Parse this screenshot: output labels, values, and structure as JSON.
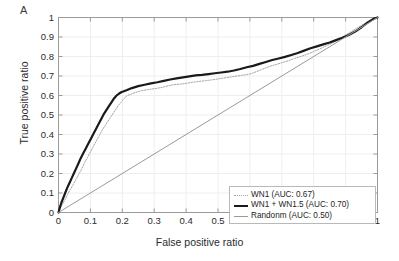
{
  "panel": {
    "label": "A"
  },
  "axes": {
    "xlabel": "False positive ratio",
    "ylabel": "True positive ratio",
    "xticks": [
      "0",
      "0.1",
      "0.2",
      "0.3",
      "0.4",
      "0.5",
      "0.6",
      "0.7",
      "0.8",
      "0.9",
      "1"
    ],
    "yticks": [
      "1",
      "0.9",
      "0.8",
      "0.7",
      "0.6",
      "0.5",
      "0.4",
      "0.3",
      "0.2",
      "0.1",
      "0"
    ]
  },
  "legend": {
    "items": [
      {
        "label": "WN1 (AUC: 0.67)",
        "style": "dotted-gray",
        "color": "#a6a6a6"
      },
      {
        "label": "WN1 + WN1.5 (AUC: 0.70)",
        "style": "thick-black",
        "color": "#1a1a1a"
      },
      {
        "label": "Randonm (AUC: 0.50)",
        "style": "thin-gray",
        "color": "#9a9a9a"
      }
    ]
  },
  "chart_data": {
    "type": "line",
    "title": "",
    "xlabel": "False positive ratio",
    "ylabel": "True positive ratio",
    "xlim": [
      0,
      1
    ],
    "ylim": [
      0,
      1
    ],
    "grid": true,
    "legend_position": "lower right",
    "series": [
      {
        "name": "WN1 (AUC: 0.67)",
        "auc": 0.67,
        "color": "#a6a6a6",
        "linestyle": "dotted",
        "linewidth": 1,
        "x": [
          0,
          0.005,
          0.012,
          0.02,
          0.028,
          0.036,
          0.045,
          0.055,
          0.063,
          0.072,
          0.08,
          0.09,
          0.1,
          0.108,
          0.118,
          0.128,
          0.138,
          0.148,
          0.158,
          0.168,
          0.178,
          0.188,
          0.196,
          0.206,
          0.215,
          0.225,
          0.24,
          0.26,
          0.28,
          0.3,
          0.32,
          0.34,
          0.36,
          0.38,
          0.4,
          0.42,
          0.44,
          0.46,
          0.48,
          0.5,
          0.52,
          0.54,
          0.56,
          0.58,
          0.6,
          0.62,
          0.64,
          0.66,
          0.68,
          0.7,
          0.72,
          0.74,
          0.76,
          0.78,
          0.8,
          0.82,
          0.84,
          0.86,
          0.88,
          0.9,
          0.92,
          0.94,
          0.96,
          0.98,
          1.0
        ],
        "y": [
          0,
          0.02,
          0.04,
          0.065,
          0.09,
          0.115,
          0.14,
          0.17,
          0.195,
          0.22,
          0.25,
          0.28,
          0.31,
          0.335,
          0.365,
          0.395,
          0.425,
          0.45,
          0.475,
          0.5,
          0.525,
          0.55,
          0.565,
          0.585,
          0.6,
          0.605,
          0.615,
          0.625,
          0.63,
          0.635,
          0.64,
          0.648,
          0.655,
          0.658,
          0.662,
          0.668,
          0.672,
          0.676,
          0.68,
          0.685,
          0.69,
          0.695,
          0.7,
          0.705,
          0.71,
          0.722,
          0.735,
          0.748,
          0.758,
          0.768,
          0.778,
          0.79,
          0.8,
          0.812,
          0.825,
          0.84,
          0.855,
          0.87,
          0.89,
          0.91,
          0.93,
          0.95,
          0.97,
          0.99,
          1.0
        ]
      },
      {
        "name": "WN1 + WN1.5 (AUC: 0.70)",
        "auc": 0.7,
        "color": "#1a1a1a",
        "linestyle": "solid",
        "linewidth": 2.2,
        "x": [
          0,
          0.004,
          0.009,
          0.015,
          0.021,
          0.027,
          0.034,
          0.041,
          0.048,
          0.055,
          0.062,
          0.07,
          0.078,
          0.086,
          0.094,
          0.102,
          0.11,
          0.118,
          0.126,
          0.134,
          0.142,
          0.15,
          0.158,
          0.166,
          0.174,
          0.182,
          0.19,
          0.198,
          0.205,
          0.215,
          0.23,
          0.25,
          0.27,
          0.29,
          0.31,
          0.33,
          0.35,
          0.37,
          0.39,
          0.41,
          0.43,
          0.45,
          0.47,
          0.49,
          0.51,
          0.53,
          0.55,
          0.57,
          0.59,
          0.61,
          0.63,
          0.65,
          0.67,
          0.69,
          0.71,
          0.73,
          0.75,
          0.77,
          0.79,
          0.81,
          0.83,
          0.85,
          0.87,
          0.89,
          0.91,
          0.93,
          0.95,
          0.97,
          0.99,
          1.0
        ],
        "y": [
          0,
          0.025,
          0.05,
          0.075,
          0.1,
          0.125,
          0.15,
          0.175,
          0.2,
          0.225,
          0.25,
          0.28,
          0.305,
          0.33,
          0.355,
          0.38,
          0.405,
          0.43,
          0.455,
          0.48,
          0.505,
          0.525,
          0.545,
          0.565,
          0.585,
          0.6,
          0.61,
          0.618,
          0.622,
          0.628,
          0.638,
          0.648,
          0.655,
          0.662,
          0.668,
          0.675,
          0.682,
          0.688,
          0.693,
          0.698,
          0.703,
          0.706,
          0.71,
          0.714,
          0.718,
          0.722,
          0.728,
          0.736,
          0.745,
          0.752,
          0.762,
          0.772,
          0.782,
          0.79,
          0.798,
          0.808,
          0.818,
          0.83,
          0.842,
          0.852,
          0.862,
          0.872,
          0.884,
          0.896,
          0.91,
          0.928,
          0.95,
          0.975,
          0.995,
          1.0
        ]
      },
      {
        "name": "Randonm (AUC: 0.50)",
        "auc": 0.5,
        "color": "#9a9a9a",
        "linestyle": "solid",
        "linewidth": 1,
        "x": [
          0,
          1
        ],
        "y": [
          0,
          1
        ]
      }
    ]
  }
}
